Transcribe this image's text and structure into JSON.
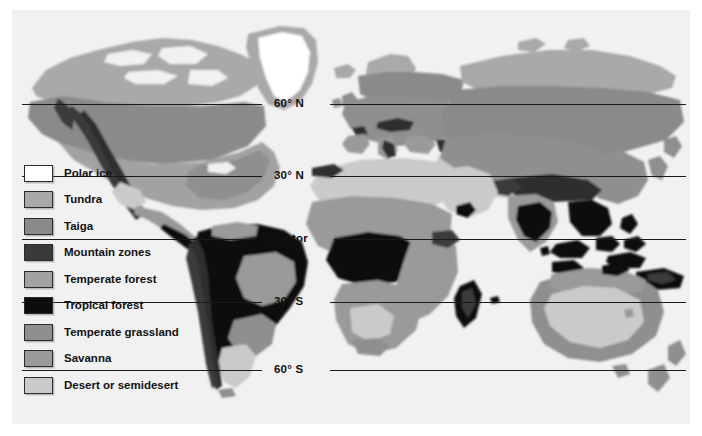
{
  "figure": {
    "background_color": "#f1f1f1",
    "page_color": "#ffffff"
  },
  "legend": {
    "items": [
      {
        "label": "Polar ice",
        "color": "#ffffff"
      },
      {
        "label": "Tundra",
        "color": "#a9a9a9"
      },
      {
        "label": "Taiga",
        "color": "#8a8a8a"
      },
      {
        "label": "Mountain zones",
        "color": "#3a3a3a"
      },
      {
        "label": "Temperate forest",
        "color": "#a2a2a2"
      },
      {
        "label": "Tropical forest",
        "color": "#0d0d0d"
      },
      {
        "label": "Temperate grassland",
        "color": "#8f8f8f"
      },
      {
        "label": "Savanna",
        "color": "#9a9a9a"
      },
      {
        "label": "Desert or semidesert",
        "color": "#cacaca"
      }
    ]
  },
  "latitudes": [
    {
      "label": "60° N",
      "y": 104,
      "label_x": 274,
      "gap_left": 262,
      "gap_right": 330
    },
    {
      "label": "30° N",
      "y": 176,
      "label_x": 274,
      "gap_left": 262,
      "gap_right": 330
    },
    {
      "label": "Equator",
      "y": 239,
      "label_x": 263,
      "gap_left": 256,
      "gap_right": 334
    },
    {
      "label": "30° S",
      "y": 302,
      "label_x": 274,
      "gap_left": 262,
      "gap_right": 330
    },
    {
      "label": "60° S",
      "y": 370,
      "label_x": 274,
      "gap_left": 262,
      "gap_right": 330
    }
  ],
  "line_extent": {
    "x_start": 22,
    "x_end": 686
  }
}
